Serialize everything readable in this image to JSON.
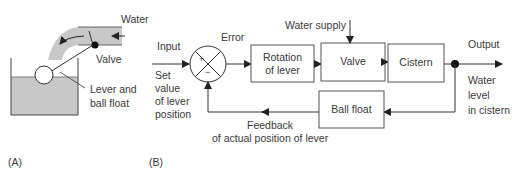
{
  "panel_a": {
    "label": "(A)",
    "water": "Water",
    "valve": "Valve",
    "lever_line1": "Lever and",
    "lever_line2": "ball float"
  },
  "panel_b": {
    "label": "(B)",
    "input": "Input",
    "set_value": [
      "Set",
      "value",
      "of lever",
      "position"
    ],
    "error": "Error",
    "water_supply": "Water supply",
    "plus": "+",
    "minus": "−",
    "blocks": {
      "rotation_line1": "Rotation",
      "rotation_line2": "of lever",
      "valve": "Valve",
      "cistern": "Cistern",
      "ball_float": "Ball float"
    },
    "output": "Output",
    "water_level": [
      "Water",
      "level",
      "in cistern"
    ],
    "feedback_line1": "Feedback",
    "feedback_line2": "of actual position of lever"
  },
  "colors": {
    "line": "#333333",
    "water_fill": "#c8c8c8",
    "box_border": "#555555"
  }
}
